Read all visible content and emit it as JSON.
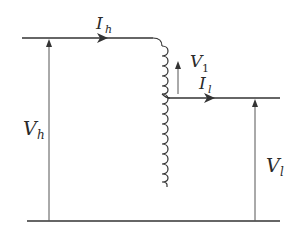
{
  "diagram": {
    "type": "autotransformer-circuit",
    "colors": {
      "line": "#333333",
      "text": "#2a2a2a",
      "background": "#ffffff"
    },
    "labels": {
      "Ih": {
        "main": "I",
        "sub": "h"
      },
      "Il": {
        "main": "I",
        "sub": "l"
      },
      "V1": {
        "main": "V",
        "sub": "1"
      },
      "Vh": {
        "main": "V",
        "sub": "h"
      },
      "Vl": {
        "main": "V",
        "sub": "l"
      }
    },
    "elements": [
      {
        "id": "top-wire",
        "description": "High-side input wire with current arrow I_h"
      },
      {
        "id": "coil",
        "description": "Autotransformer winding with tap"
      },
      {
        "id": "tap-wire",
        "description": "Low-side output wire with current arrow I_l"
      },
      {
        "id": "bottom-wire",
        "description": "Common return wire"
      },
      {
        "id": "vh-arrow",
        "description": "High-side voltage arrow V_h"
      },
      {
        "id": "vl-arrow",
        "description": "Low-side voltage arrow V_l"
      },
      {
        "id": "v1-arrow",
        "description": "Series winding voltage arrow V_1"
      }
    ]
  }
}
